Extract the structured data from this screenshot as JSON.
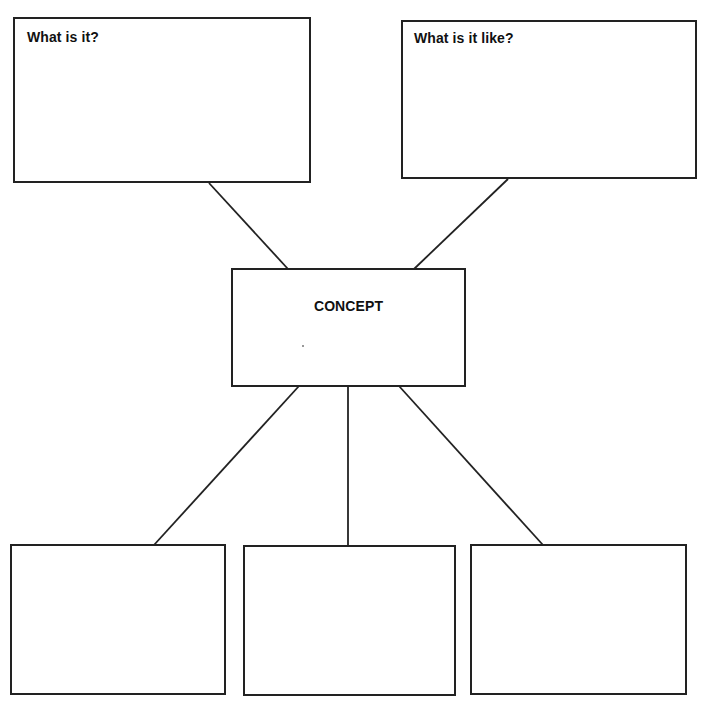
{
  "diagram": {
    "type": "concept-map-graphic-organizer",
    "center": {
      "label": "CONCEPT"
    },
    "top_boxes": [
      {
        "label": "What is it?"
      },
      {
        "label": "What is it like?"
      }
    ],
    "bottom_boxes": [
      {
        "label": ""
      },
      {
        "label": ""
      },
      {
        "label": ""
      }
    ],
    "colors": {
      "stroke": "#222222",
      "text": "#111111",
      "background": "#ffffff"
    }
  }
}
